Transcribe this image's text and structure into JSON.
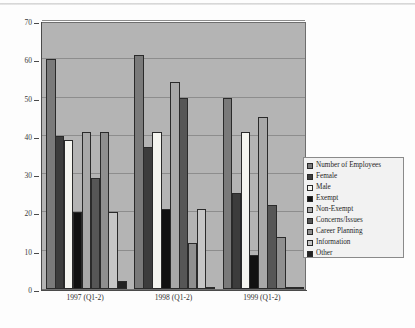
{
  "chart_data": {
    "type": "bar",
    "title": "",
    "subtitle": "",
    "xlabel": "",
    "ylabel": "",
    "ylim": [
      0,
      70
    ],
    "yticks": [
      0,
      10,
      20,
      30,
      40,
      50,
      60,
      70
    ],
    "grid": true,
    "legend_position": "right",
    "orientation": "vertical",
    "grouping": "grouped",
    "categories": [
      "1997 (Q1-2)",
      "1998 (Q1-2)",
      "1999 (Q1-2)"
    ],
    "series": [
      {
        "name": "Number of Employees",
        "color": "#7a7a7a",
        "values": [
          60,
          61,
          50
        ]
      },
      {
        "name": "Female",
        "color": "#3c3c3c",
        "values": [
          40,
          37,
          25
        ]
      },
      {
        "name": "Male",
        "color": "#f5f5f0",
        "values": [
          39,
          41,
          41
        ]
      },
      {
        "name": "Exempt",
        "color": "#111111",
        "values": [
          20,
          21,
          9
        ]
      },
      {
        "name": "Non-Exempt",
        "color": "#a8a8a8",
        "values": [
          41,
          54,
          45
        ]
      },
      {
        "name": "Concerns/Issues",
        "color": "#565656",
        "values": [
          29,
          50,
          22
        ]
      },
      {
        "name": "Career Planning",
        "color": "#8f8f8f",
        "values": [
          41,
          12,
          13.5
        ]
      },
      {
        "name": "Information",
        "color": "#c6c6c6",
        "values": [
          20,
          21,
          0.5
        ]
      },
      {
        "name": "Other",
        "color": "#222222",
        "values": [
          2,
          0.5,
          0.5
        ]
      }
    ]
  },
  "legend": {
    "items": [
      {
        "label": "Number of Employees"
      },
      {
        "label": "Female"
      },
      {
        "label": "Male"
      },
      {
        "label": "Exempt"
      },
      {
        "label": "Non-Exempt"
      },
      {
        "label": "Concerns/Issues"
      },
      {
        "label": "Career Planning"
      },
      {
        "label": "Information"
      },
      {
        "label": "Other"
      }
    ]
  }
}
